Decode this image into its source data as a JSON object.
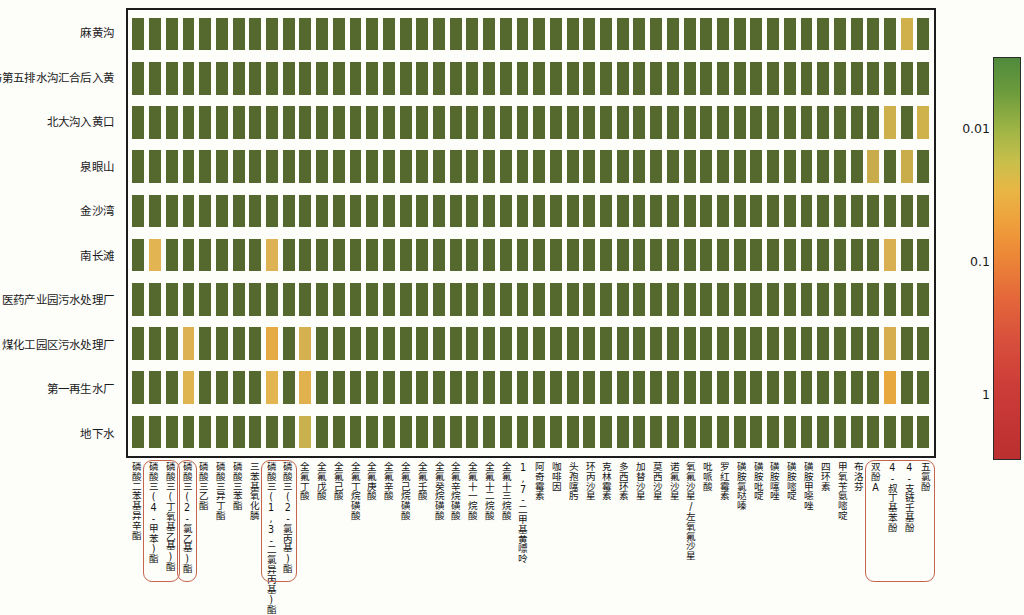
{
  "chart_data": {
    "type": "heatmap",
    "title": "",
    "xlabel": "",
    "ylabel": "",
    "colorbar": {
      "scale": "log",
      "ticks": [
        "0.01",
        "0.1",
        "1"
      ],
      "tick_positions_pct": [
        17.5,
        50.5,
        83.5
      ],
      "low_color": "#4f8a3d",
      "mid_color": "#e8b645",
      "high_color": "#bb2f30",
      "orientation": "vertical",
      "position": "right"
    },
    "row_categories": [
      "麻黄沟",
      "第三与第五排水沟汇合后入黄",
      "北大沟入黄口",
      "泉眼山",
      "金沙湾",
      "南长滩",
      "医药产业园污水处理厂",
      "煤化工园区污水处理厂",
      "第一再生水厂",
      "地下水"
    ],
    "column_categories": [
      "磷酸二苯基异辛酯",
      "磷酸三(4-甲苯)酯",
      "磷酸三(丁氧基乙基)酯",
      "磷酸三(2-氯乙基)酯",
      "磷酸三乙酯",
      "磷酸三异丁酯",
      "磷酸三苯酯",
      "三苯基氧化膦",
      "磷酸三(1,3-二氯异丙基)酯",
      "磷酸三(2-氯丙基)酯",
      "全氟丁酸",
      "全氟戊酸",
      "全氟己酸",
      "全氟丁烷磺酸",
      "全氟庚酸",
      "全氟辛酸",
      "全氟己烷磺酸",
      "全氟壬酸",
      "全氟癸烷磺酸",
      "全氟辛烷磺酸",
      "全氟十一烷酸",
      "全氟十二烷酸",
      "全氟十三烷酸",
      "1,7-二甲基黄嘌呤",
      "阿奇霉素",
      "咖啡因",
      "头孢噻肟",
      "环丙沙星",
      "克林霉素",
      "多西环素",
      "加替沙星",
      "莫西沙星",
      "诺氟沙星",
      "氧氟沙星/左氧氟沙星",
      "吡哌酸",
      "罗红霉素",
      "磺胺氯哒嗪",
      "磺胺吡啶",
      "磺胺噻唑",
      "磺胺嘧啶",
      "磺胺甲噁唑",
      "四环素",
      "甲氧苄氨嘧啶",
      "布洛芬",
      "双酚A",
      "4-叔丁基苯酚",
      "4-支链壬基酚",
      "五氯酚"
    ],
    "highlight_groups": [
      {
        "name": "group-1",
        "start_col": 1,
        "end_col": 2
      },
      {
        "name": "group-2",
        "start_col": 3,
        "end_col": 3
      },
      {
        "name": "group-3",
        "start_col": 8,
        "end_col": 9
      },
      {
        "name": "group-4",
        "start_col": 44,
        "end_col": 47
      }
    ],
    "cells": [
      {
        "row": 0,
        "col": 46,
        "color": "#d0b04a"
      },
      {
        "row": 2,
        "col": 45,
        "color": "#cdb04c"
      },
      {
        "row": 2,
        "col": 47,
        "color": "#cfb24c"
      },
      {
        "row": 3,
        "col": 44,
        "color": "#c8ab4a"
      },
      {
        "row": 3,
        "col": 46,
        "color": "#c9ad4b"
      },
      {
        "row": 5,
        "col": 1,
        "color": "#e2b552"
      },
      {
        "row": 5,
        "col": 8,
        "color": "#dcb254"
      },
      {
        "row": 5,
        "col": 45,
        "color": "#d8b052"
      },
      {
        "row": 7,
        "col": 3,
        "color": "#dcb152"
      },
      {
        "row": 7,
        "col": 8,
        "color": "#e4ab44"
      },
      {
        "row": 7,
        "col": 10,
        "color": "#d5b04f"
      },
      {
        "row": 7,
        "col": 45,
        "color": "#d6ae4f"
      },
      {
        "row": 8,
        "col": 3,
        "color": "#ddb44f"
      },
      {
        "row": 8,
        "col": 8,
        "color": "#e3b54e"
      },
      {
        "row": 8,
        "col": 10,
        "color": "#e0b14c"
      },
      {
        "row": 8,
        "col": 45,
        "color": "#e7a93f"
      },
      {
        "row": 9,
        "col": 10,
        "color": "#c9b24e"
      }
    ],
    "default_color": "#55682e",
    "n_rows": 10,
    "n_cols": 48
  },
  "axis": {
    "row_label_font_px": 11.5,
    "col_label_font_px": 9.6
  }
}
